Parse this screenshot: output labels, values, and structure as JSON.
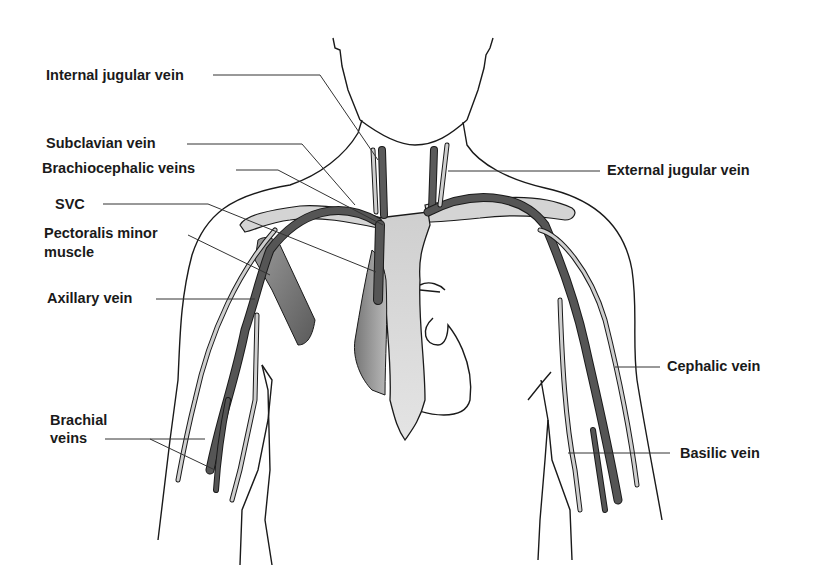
{
  "diagram": {
    "colors": {
      "outline": "#1a1a1a",
      "vein_dark": "#555555",
      "vein_light": "#c8c8c8",
      "bone": "#d6d6d6",
      "muscle": "#777777",
      "leader": "#333333"
    },
    "labels": {
      "internal_jugular": "Internal jugular vein",
      "subclavian": "Subclavian vein",
      "brachiocephalic": "Brachiocephalic veins",
      "svc": "SVC",
      "pectoralis_1": "Pectoralis minor",
      "pectoralis_2": "muscle",
      "axillary": "Axillary vein",
      "brachial_1": "Brachial",
      "brachial_2": "veins",
      "external_jugular": "External jugular vein",
      "cephalic": "Cephalic vein",
      "basilic": "Basilic vein"
    }
  }
}
